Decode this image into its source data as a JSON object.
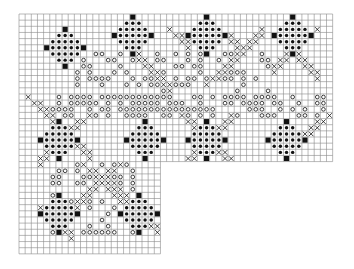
{
  "chart": {
    "origin_x": 19,
    "origin_y": 14,
    "cell": 6.15,
    "top_band": {
      "cols": 51,
      "rows": 24
    },
    "side_band": {
      "cols": 23,
      "rows": 39
    },
    "colors": {
      "grid": "#8a8a8a",
      "ink": "#111111",
      "paper": "#ffffff"
    },
    "symbols": {
      "filled_square": "solid black stitch",
      "dot": "dark filled dot",
      "ring": "open circle",
      "cross": "X stitch"
    },
    "diamond_motifs_top": [
      {
        "cx": 7,
        "cy": 5
      },
      {
        "cx": 18,
        "cy": 3
      },
      {
        "cx": 30,
        "cy": 3
      },
      {
        "cx": 44,
        "cy": 3
      }
    ],
    "diamond_motifs_lower": [
      {
        "cx": 6,
        "cy": 20
      },
      {
        "cx": 20,
        "cy": 20
      },
      {
        "cx": 30,
        "cy": 20
      },
      {
        "cx": 43,
        "cy": 20
      },
      {
        "cx": 6,
        "cy": 32
      },
      {
        "cx": 19,
        "cy": 32
      }
    ],
    "cross_lines": [
      {
        "x1": 15,
        "y1": 3,
        "x2": 24,
        "y2": 11
      },
      {
        "x1": 30,
        "y1": 11,
        "x2": 39,
        "y2": 2
      },
      {
        "x1": 24,
        "y1": 2,
        "x2": 27,
        "y2": 5
      },
      {
        "x1": 32,
        "y1": 2,
        "x2": 35,
        "y2": 5
      },
      {
        "x1": 48,
        "y1": 2,
        "x2": 41,
        "y2": 9
      },
      {
        "x1": 41,
        "y1": 3,
        "x2": 48,
        "y2": 10
      },
      {
        "x1": 1,
        "y1": 13,
        "x2": 11,
        "y2": 23
      },
      {
        "x1": 11,
        "y1": 16,
        "x2": 3,
        "y2": 24
      },
      {
        "x1": 26,
        "y1": 16,
        "x2": 34,
        "y2": 24
      },
      {
        "x1": 26,
        "y1": 24,
        "x2": 34,
        "y2": 16
      },
      {
        "x1": 50,
        "y1": 16,
        "x2": 45,
        "y2": 21
      },
      {
        "x1": 16,
        "y1": 24,
        "x2": 7,
        "y2": 33
      },
      {
        "x1": 10,
        "y1": 24,
        "x2": 19,
        "y2": 33
      },
      {
        "x1": 3,
        "y1": 31,
        "x2": 6,
        "y2": 36
      },
      {
        "x1": 12,
        "y1": 25,
        "x2": 19,
        "y2": 38
      }
    ],
    "ring_regions": [
      {
        "x": 9,
        "y": 6,
        "w": 32,
        "h": 10,
        "density": 0.35
      },
      {
        "x": 4,
        "y": 13,
        "w": 46,
        "h": 4,
        "density": 0.45
      },
      {
        "x": 5,
        "y": 24,
        "w": 14,
        "h": 12,
        "density": 0.3
      }
    ]
  }
}
